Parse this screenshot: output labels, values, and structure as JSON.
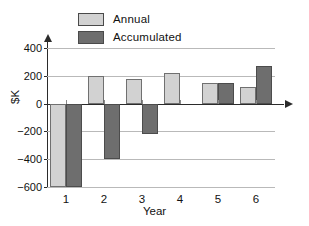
{
  "chart_data": {
    "type": "bar",
    "title": "",
    "subtitle": "",
    "xlabel": "Year",
    "ylabel": "$K",
    "categories": [
      "1",
      "2",
      "3",
      "4",
      "5",
      "6"
    ],
    "series": [
      {
        "name": "Annual",
        "color": "#d2d2d2",
        "values": [
          -600,
          200,
          180,
          220,
          150,
          120
        ]
      },
      {
        "name": "Accumulated",
        "color": "#6e6e6e",
        "values": [
          -600,
          -400,
          -220,
          0,
          150,
          270
        ]
      }
    ],
    "ylim": [
      -600,
      400
    ],
    "yticks": [
      400,
      200,
      0,
      -200,
      -400,
      -600
    ],
    "ytick_labels": [
      "400",
      "200",
      "0",
      "−200",
      "−400",
      "−600"
    ],
    "grid": true,
    "grid_axis": "y",
    "legend_position": "top-left",
    "axis_arrows": true
  },
  "legend": {
    "items": [
      {
        "label": "Annual",
        "color": "#d2d2d2"
      },
      {
        "label": "Accumulated",
        "color": "#6e6e6e"
      }
    ]
  },
  "axes": {
    "y_title": "$K",
    "x_title": "Year"
  },
  "colors": {
    "annual": "#d2d2d2",
    "accumulated": "#6e6e6e",
    "axis": "#2b2b2b",
    "grid": "#b9b9b9",
    "text": "#111111",
    "background": "#ffffff"
  }
}
